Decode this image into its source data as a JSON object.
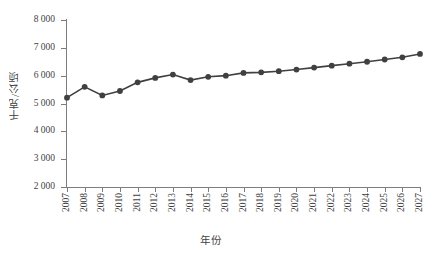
{
  "chart_data": {
    "type": "line",
    "title": "",
    "subtitle": "",
    "xlabel": "年份",
    "ylabel": "千克/公顷",
    "categories": [
      "2007",
      "2008",
      "2009",
      "2010",
      "2011",
      "2012",
      "2013",
      "2014",
      "2015",
      "2016",
      "2017",
      "2018",
      "2019",
      "2020",
      "2021",
      "2022",
      "2023",
      "2024",
      "2025",
      "2026",
      "2027"
    ],
    "values": [
      5210,
      5600,
      5290,
      5450,
      5760,
      5920,
      6040,
      5840,
      5960,
      6000,
      6100,
      6120,
      6160,
      6220,
      6290,
      6360,
      6430,
      6500,
      6580,
      6660,
      6780
    ],
    "ylim": [
      2000,
      8000
    ],
    "ytick_values": [
      8000,
      7000,
      6000,
      5000,
      4000,
      3000,
      2000
    ],
    "ytick_labels": [
      "8 000",
      "7 000",
      "6 000",
      "5 000",
      "4 000",
      "3 000",
      "2 000"
    ],
    "grid": false,
    "legend": false,
    "legend_position": "none",
    "series_color": "#404040",
    "marker": "circle",
    "axis_color": "#7d7d7d"
  }
}
